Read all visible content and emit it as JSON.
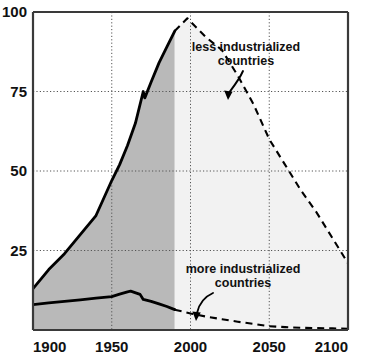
{
  "chart_data": {
    "type": "area",
    "title": "",
    "subtitle": "",
    "xlabel": "",
    "ylabel": "",
    "xlim": [
      1900,
      2100
    ],
    "ylim": [
      0,
      100
    ],
    "xticks": [
      1900,
      1950,
      2000,
      2050,
      2100
    ],
    "xtick_labels": [
      "1900",
      "1950",
      "2000",
      "2050",
      "2100"
    ],
    "yticks": [
      25,
      50,
      75,
      100
    ],
    "ytick_labels": [
      "25",
      "50",
      "75",
      "100"
    ],
    "grid": "dotted gridlines at y = 25, 50, 75 and x = 1950, 2000, 2050",
    "legend_position": "inline annotations with curved arrows",
    "historical_range": [
      1900,
      1990
    ],
    "projection_range": [
      1990,
      2100
    ],
    "shading": {
      "historical_fill": "#b9b9b9",
      "projection_fill": "#f2f2f2"
    },
    "line_color": "#000000",
    "series": [
      {
        "name": "less industrialized countries",
        "style_historical": "solid",
        "style_projection": "dashed",
        "x": [
          1900,
          1910,
          1920,
          1930,
          1940,
          1950,
          1955,
          1960,
          1965,
          1970,
          1971,
          1975,
          1980,
          1985,
          1990,
          1998,
          2010,
          2020,
          2030,
          2040,
          2050,
          2060,
          2070,
          2080,
          2090,
          2100
        ],
        "values": [
          13,
          19,
          24,
          30,
          36,
          47,
          52,
          58,
          65,
          75,
          73,
          78,
          84,
          89,
          94,
          98,
          92,
          88,
          80,
          71,
          60,
          52,
          44,
          37,
          29,
          21
        ]
      },
      {
        "name": "more industrialized countries",
        "style_historical": "solid",
        "style_projection": "dashed",
        "x": [
          1900,
          1910,
          1920,
          1930,
          1940,
          1950,
          1955,
          1960,
          1962,
          1968,
          1970,
          1975,
          1980,
          1985,
          1990,
          2000,
          2010,
          2020,
          2030,
          2040,
          2050,
          2060,
          2070,
          2080,
          2090,
          2100
        ],
        "values": [
          8,
          8.5,
          9,
          9.5,
          10,
          10.5,
          11.3,
          12,
          12.2,
          11.2,
          9.6,
          9.0,
          8.2,
          7.4,
          6.4,
          5.2,
          4.2,
          3.4,
          2.6,
          1.9,
          1.2,
          0.9,
          0.7,
          0.6,
          0.5,
          0.4
        ]
      }
    ],
    "annotations": [
      {
        "name": "less-industrialized-label",
        "line1": "less industrialized",
        "line2": "countries",
        "arrow": "curved arrow pointing down-left toward the upper dashed curve"
      },
      {
        "name": "more-industrialized-label",
        "line1": "more industrialized",
        "line2": "countries",
        "arrow": "curved arrow pointing down-left toward the lower dashed curve"
      }
    ]
  }
}
